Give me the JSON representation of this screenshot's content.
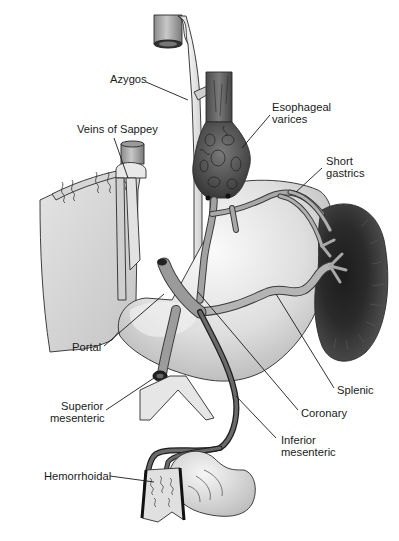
{
  "diagram": {
    "style": "grayscale medical illustration",
    "colors": {
      "background": "#ffffff",
      "organ_light": "#dcdcdc",
      "organ_mid": "#bdbdbd",
      "vessel": "#9a9a9a",
      "vessel_dark": "#6e6e6e",
      "spleen": "#3c3c3c",
      "text": "#1a1a1a"
    },
    "structures": [
      "liver",
      "stomach",
      "spleen",
      "esophagus",
      "inferior vena cava",
      "aorta",
      "colon",
      "rectum"
    ],
    "labels": [
      {
        "id": "azygos",
        "lines": [
          "Azygos"
        ]
      },
      {
        "id": "esophageal-varices",
        "lines": [
          "Esophageal",
          "varices"
        ]
      },
      {
        "id": "veins-of-sappey",
        "lines": [
          "Veins of Sappey"
        ]
      },
      {
        "id": "short-gastrics",
        "lines": [
          "Short",
          "gastrics"
        ]
      },
      {
        "id": "portal",
        "lines": [
          "Portal"
        ]
      },
      {
        "id": "splenic",
        "lines": [
          "Splenic"
        ]
      },
      {
        "id": "superior-mesenteric",
        "lines": [
          "Superior",
          "mesenteric"
        ]
      },
      {
        "id": "coronary",
        "lines": [
          "Coronary"
        ]
      },
      {
        "id": "inferior-mesenteric",
        "lines": [
          "Inferior",
          "mesenteric"
        ]
      },
      {
        "id": "hemorrhoidal",
        "lines": [
          "Hemorrhoidal"
        ]
      }
    ]
  }
}
